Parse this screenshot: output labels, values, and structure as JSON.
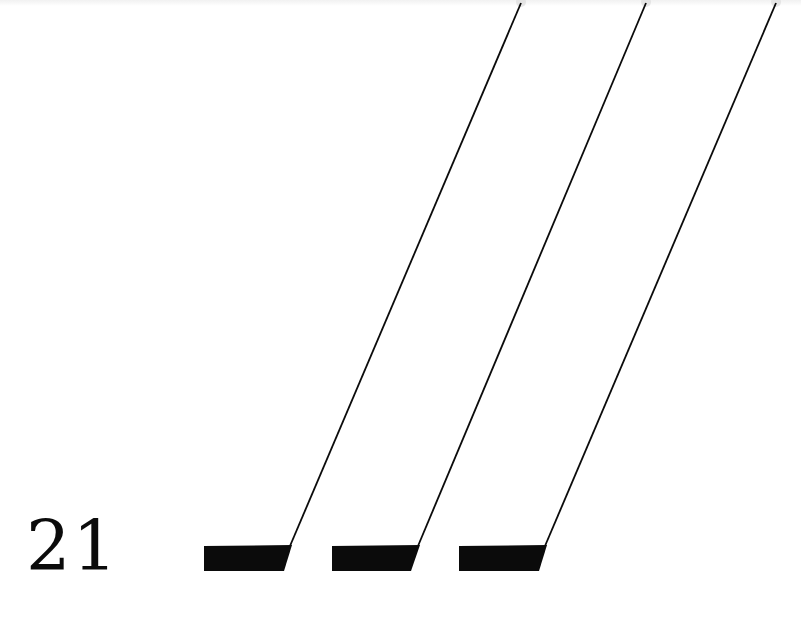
{
  "label": {
    "text": "21"
  },
  "colors": {
    "ink": "#0b0b0b",
    "background": "#ffffff"
  },
  "marks": [
    {
      "name": "mark-1",
      "bar": {
        "x0": 204,
        "x1": 292,
        "y0": 545,
        "y1": 571,
        "bottom_right": 284
      },
      "line_top": {
        "x": 521,
        "y": 3
      }
    },
    {
      "name": "mark-2",
      "bar": {
        "x0": 332,
        "x1": 420,
        "y0": 545,
        "y1": 571,
        "bottom_right": 411
      },
      "line_top": {
        "x": 646,
        "y": 3
      }
    },
    {
      "name": "mark-3",
      "bar": {
        "x0": 459,
        "x1": 547,
        "y0": 545,
        "y1": 571,
        "bottom_right": 539
      },
      "line_top": {
        "x": 776,
        "y": 3
      }
    }
  ]
}
